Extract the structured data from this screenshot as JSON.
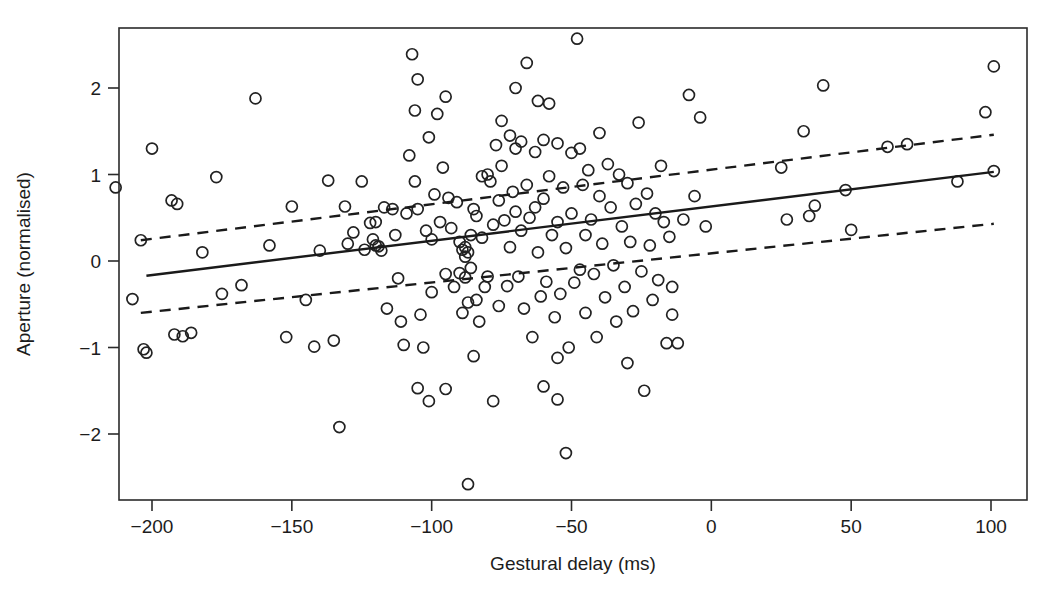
{
  "chart_data": {
    "type": "scatter",
    "title": "",
    "xlabel": "Gestural delay (ms)",
    "ylabel": "Aperture (normalised)",
    "xlim": [
      -215,
      110
    ],
    "ylim": [
      -2.75,
      2.72
    ],
    "xticks": [
      -200,
      -150,
      -100,
      -50,
      0,
      50,
      100
    ],
    "xticklabels": [
      "−200",
      "−150",
      "−100",
      "−50",
      "0",
      "50",
      "100"
    ],
    "yticks": [
      -2,
      -1,
      0,
      1,
      2
    ],
    "yticklabels": [
      "−2",
      "−1",
      "0",
      "1",
      "2"
    ],
    "grid": false,
    "legend": null,
    "marker": "open-circle",
    "marker_size": 7,
    "series": [
      {
        "name": "observations",
        "type": "scatter",
        "points": [
          [
            -213,
            0.85
          ],
          [
            -207,
            -0.44
          ],
          [
            -204,
            0.24
          ],
          [
            -203,
            -1.02
          ],
          [
            -202,
            -1.06
          ],
          [
            -200,
            1.3
          ],
          [
            -193,
            0.7
          ],
          [
            -191,
            0.66
          ],
          [
            -192,
            -0.85
          ],
          [
            -189,
            -0.87
          ],
          [
            -186,
            -0.83
          ],
          [
            -177,
            0.97
          ],
          [
            -163,
            1.88
          ],
          [
            -152,
            -0.88
          ],
          [
            -150,
            0.63
          ],
          [
            -142,
            -0.99
          ],
          [
            -137,
            0.93
          ],
          [
            -135,
            -0.92
          ],
          [
            -133,
            -1.92
          ],
          [
            -131,
            0.63
          ],
          [
            -128,
            0.33
          ],
          [
            -124,
            0.13
          ],
          [
            -122,
            0.44
          ],
          [
            -121,
            0.25
          ],
          [
            -120,
            0.18
          ],
          [
            -119,
            0.17
          ],
          [
            -118,
            0.12
          ],
          [
            -117,
            0.62
          ],
          [
            -116,
            -0.55
          ],
          [
            -114,
            0.6
          ],
          [
            -113,
            0.3
          ],
          [
            -112,
            -0.2
          ],
          [
            -111,
            -0.7
          ],
          [
            -110,
            -0.97
          ],
          [
            -109,
            0.55
          ],
          [
            -108,
            1.22
          ],
          [
            -107,
            2.39
          ],
          [
            -106,
            0.92
          ],
          [
            -106,
            1.74
          ],
          [
            -105,
            2.1
          ],
          [
            -105,
            0.6
          ],
          [
            -104,
            -0.62
          ],
          [
            -103,
            -1.0
          ],
          [
            -102,
            0.35
          ],
          [
            -101,
            1.43
          ],
          [
            -100,
            0.25
          ],
          [
            -100,
            -0.36
          ],
          [
            -99,
            0.77
          ],
          [
            -98,
            1.7
          ],
          [
            -97,
            0.45
          ],
          [
            -96,
            1.08
          ],
          [
            -95,
            -0.15
          ],
          [
            -95,
            -1.48
          ],
          [
            -94,
            0.73
          ],
          [
            -93,
            0.38
          ],
          [
            -92,
            -0.3
          ],
          [
            -91,
            0.68
          ],
          [
            -90,
            0.22
          ],
          [
            -90,
            -0.14
          ],
          [
            -89,
            0.13
          ],
          [
            -89,
            -0.6
          ],
          [
            -88,
            0.16
          ],
          [
            -88,
            0.05
          ],
          [
            -88,
            -0.19
          ],
          [
            -87,
            0.1
          ],
          [
            -87,
            -0.48
          ],
          [
            -87,
            -2.58
          ],
          [
            -86,
            0.3
          ],
          [
            -86,
            -0.08
          ],
          [
            -85,
            0.6
          ],
          [
            -85,
            -1.1
          ],
          [
            -84,
            0.52
          ],
          [
            -84,
            -0.45
          ],
          [
            -83,
            -0.7
          ],
          [
            -82,
            0.98
          ],
          [
            -82,
            0.27
          ],
          [
            -81,
            -0.3
          ],
          [
            -80,
            1.0
          ],
          [
            -80,
            -0.18
          ],
          [
            -79,
            0.92
          ],
          [
            -78,
            0.42
          ],
          [
            -78,
            -1.62
          ],
          [
            -77,
            1.34
          ],
          [
            -76,
            0.7
          ],
          [
            -76,
            -0.52
          ],
          [
            -75,
            1.1
          ],
          [
            -74,
            0.47
          ],
          [
            -73,
            -0.29
          ],
          [
            -72,
            1.45
          ],
          [
            -72,
            0.16
          ],
          [
            -71,
            0.8
          ],
          [
            -70,
            1.3
          ],
          [
            -70,
            0.57
          ],
          [
            -69,
            -0.18
          ],
          [
            -68,
            1.38
          ],
          [
            -68,
            0.35
          ],
          [
            -67,
            -0.55
          ],
          [
            -66,
            2.29
          ],
          [
            -66,
            0.88
          ],
          [
            -65,
            0.5
          ],
          [
            -64,
            -0.88
          ],
          [
            -63,
            1.26
          ],
          [
            -63,
            0.62
          ],
          [
            -62,
            0.1
          ],
          [
            -61,
            -0.41
          ],
          [
            -60,
            1.4
          ],
          [
            -60,
            0.72
          ],
          [
            -59,
            -0.24
          ],
          [
            -58,
            0.98
          ],
          [
            -57,
            0.3
          ],
          [
            -56,
            -0.65
          ],
          [
            -55,
            1.36
          ],
          [
            -55,
            0.45
          ],
          [
            -54,
            -0.38
          ],
          [
            -53,
            0.85
          ],
          [
            -52,
            0.15
          ],
          [
            -51,
            -1.0
          ],
          [
            -50,
            1.25
          ],
          [
            -50,
            0.55
          ],
          [
            -49,
            -0.25
          ],
          [
            -48,
            2.57
          ],
          [
            -47,
            1.3
          ],
          [
            -46,
            0.88
          ],
          [
            -45,
            0.3
          ],
          [
            -45,
            -0.6
          ],
          [
            -44,
            1.05
          ],
          [
            -43,
            0.48
          ],
          [
            -42,
            -0.15
          ],
          [
            -41,
            -0.88
          ],
          [
            -40,
            1.48
          ],
          [
            -40,
            0.75
          ],
          [
            -39,
            0.2
          ],
          [
            -38,
            -0.42
          ],
          [
            -37,
            1.12
          ],
          [
            -36,
            0.62
          ],
          [
            -35,
            -0.05
          ],
          [
            -34,
            -0.7
          ],
          [
            -33,
            1.0
          ],
          [
            -32,
            0.4
          ],
          [
            -31,
            -0.3
          ],
          [
            -30,
            0.9
          ],
          [
            -29,
            0.22
          ],
          [
            -28,
            -0.58
          ],
          [
            -27,
            0.66
          ],
          [
            -26,
            1.6
          ],
          [
            -25,
            -0.12
          ],
          [
            -24,
            -1.5
          ],
          [
            -23,
            0.78
          ],
          [
            -22,
            0.18
          ],
          [
            -21,
            -0.45
          ],
          [
            -20,
            0.55
          ],
          [
            -19,
            -0.22
          ],
          [
            -18,
            1.1
          ],
          [
            -17,
            0.45
          ],
          [
            -16,
            -0.95
          ],
          [
            -15,
            0.28
          ],
          [
            -14,
            -0.3
          ],
          [
            -12,
            -0.95
          ],
          [
            -10,
            0.48
          ],
          [
            -8,
            1.92
          ],
          [
            -6,
            0.75
          ],
          [
            -4,
            1.66
          ],
          [
            -2,
            0.4
          ],
          [
            -60,
            -1.45
          ],
          [
            -55,
            -1.6
          ],
          [
            -52,
            -2.22
          ],
          [
            -58,
            1.82
          ],
          [
            -62,
            1.85
          ],
          [
            -70,
            2.0
          ],
          [
            -75,
            1.62
          ],
          [
            -95,
            1.9
          ],
          [
            -120,
            0.45
          ],
          [
            -125,
            0.92
          ],
          [
            -130,
            0.2
          ],
          [
            -140,
            0.12
          ],
          [
            -145,
            -0.45
          ],
          [
            -158,
            0.18
          ],
          [
            -168,
            -0.28
          ],
          [
            -175,
            -0.38
          ],
          [
            -182,
            0.1
          ],
          [
            25,
            1.08
          ],
          [
            27,
            0.48
          ],
          [
            33,
            1.5
          ],
          [
            35,
            0.52
          ],
          [
            37,
            0.64
          ],
          [
            40,
            2.03
          ],
          [
            48,
            0.82
          ],
          [
            50,
            0.36
          ],
          [
            63,
            1.32
          ],
          [
            70,
            1.35
          ],
          [
            88,
            0.92
          ],
          [
            98,
            1.72
          ],
          [
            101,
            2.25
          ],
          [
            101,
            1.04
          ],
          [
            -105,
            -1.47
          ],
          [
            -101,
            -1.62
          ],
          [
            -55,
            -1.12
          ],
          [
            -47,
            -0.1
          ],
          [
            -30,
            -1.18
          ],
          [
            -14,
            -0.62
          ]
        ]
      }
    ],
    "fit_line": {
      "name": "regression-line",
      "style": "solid",
      "x": [
        -202,
        101
      ],
      "y": [
        -0.17,
        1.03
      ]
    },
    "confidence_bands": [
      {
        "name": "upper-confidence-band",
        "style": "dashed",
        "x": [
          -204,
          101
        ],
        "y": [
          0.24,
          1.46
        ]
      },
      {
        "name": "lower-confidence-band",
        "style": "dashed",
        "x": [
          -204,
          101
        ],
        "y": [
          -0.6,
          0.43
        ]
      }
    ]
  }
}
